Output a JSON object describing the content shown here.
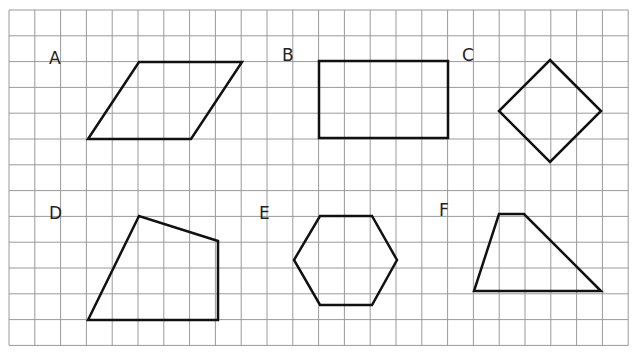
{
  "grid": {
    "left": 9,
    "top": 10,
    "cell": 25.8,
    "cols": 24,
    "rows": 13,
    "line_color": "#9a9a9a",
    "shape_color": "#111111"
  },
  "shapes": [
    {
      "label": "A",
      "name": "parallelogram",
      "label_pos": [
        49,
        64
      ],
      "points": [
        [
          88,
          139
        ],
        [
          139,
          62
        ],
        [
          242,
          62
        ],
        [
          191,
          139
        ]
      ]
    },
    {
      "label": "B",
      "name": "rectangle",
      "label_pos": [
        282,
        61
      ],
      "points": [
        [
          319,
          61
        ],
        [
          448,
          61
        ],
        [
          448,
          138
        ],
        [
          319,
          138
        ]
      ]
    },
    {
      "label": "C",
      "name": "square-rotated",
      "label_pos": [
        462,
        61
      ],
      "points": [
        [
          550,
          60
        ],
        [
          601,
          111
        ],
        [
          550,
          162
        ],
        [
          499,
          111
        ]
      ]
    },
    {
      "label": "D",
      "name": "irregular-quadrilateral",
      "label_pos": [
        49,
        219
      ],
      "points": [
        [
          88,
          320
        ],
        [
          139,
          216
        ],
        [
          218,
          241
        ],
        [
          218,
          320
        ]
      ]
    },
    {
      "label": "E",
      "name": "hexagon",
      "label_pos": [
        259,
        219
      ],
      "points": [
        [
          320,
          216
        ],
        [
          372,
          216
        ],
        [
          397,
          260
        ],
        [
          372,
          305
        ],
        [
          320,
          305
        ],
        [
          294,
          260
        ]
      ]
    },
    {
      "label": "F",
      "name": "trapezoid",
      "label_pos": [
        439,
        216
      ],
      "points": [
        [
          499,
          214
        ],
        [
          524,
          214
        ],
        [
          601,
          291
        ],
        [
          474,
          291
        ]
      ]
    }
  ]
}
